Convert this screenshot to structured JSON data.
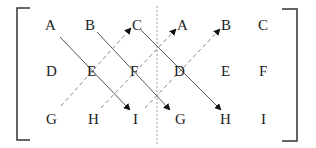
{
  "matrix_left": {
    "rows": [
      [
        "A",
        "B",
        "C"
      ],
      [
        "D",
        "E",
        "F"
      ],
      [
        "G",
        "H",
        "I"
      ]
    ]
  },
  "matrix_right": {
    "rows": [
      [
        "A",
        "B",
        "C"
      ],
      [
        "D",
        "E",
        "F"
      ],
      [
        "G",
        "H",
        "I"
      ]
    ]
  },
  "colors": {
    "line": "#555555",
    "text": "#222222",
    "divider": "#999999"
  }
}
